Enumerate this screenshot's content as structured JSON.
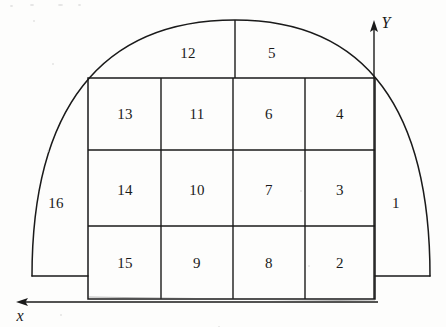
{
  "figure": {
    "title_visible": false,
    "background_color": "#fdfdfc",
    "stroke_color": "#1a1a1a",
    "axes": {
      "y_axis_label": "Y",
      "x_axis_label": "x"
    },
    "regions": [
      {
        "id": "region-1",
        "label": "1",
        "cx": 396,
        "cy": 203
      },
      {
        "id": "region-2",
        "label": "2",
        "cx": 340,
        "cy": 263
      },
      {
        "id": "region-3",
        "label": "3",
        "cx": 340,
        "cy": 190
      },
      {
        "id": "region-4",
        "label": "4",
        "cx": 340,
        "cy": 114
      },
      {
        "id": "region-5",
        "label": "5",
        "cx": 272,
        "cy": 53
      },
      {
        "id": "region-6",
        "label": "6",
        "cx": 269,
        "cy": 114
      },
      {
        "id": "region-7",
        "label": "7",
        "cx": 269,
        "cy": 190
      },
      {
        "id": "region-8",
        "label": "8",
        "cx": 269,
        "cy": 263
      },
      {
        "id": "region-9",
        "label": "9",
        "cx": 197,
        "cy": 263
      },
      {
        "id": "region-10",
        "label": "10",
        "cx": 197,
        "cy": 190
      },
      {
        "id": "region-11",
        "label": "11",
        "cx": 197,
        "cy": 114
      },
      {
        "id": "region-12",
        "label": "12",
        "cx": 188,
        "cy": 53
      },
      {
        "id": "region-13",
        "label": "13",
        "cx": 125,
        "cy": 114
      },
      {
        "id": "region-14",
        "label": "14",
        "cx": 125,
        "cy": 190
      },
      {
        "id": "region-15",
        "label": "15",
        "cx": 125,
        "cy": 263
      },
      {
        "id": "region-16",
        "label": "16",
        "cx": 56,
        "cy": 203
      }
    ],
    "geometry": {
      "grid_left": 88,
      "grid_right": 375,
      "grid_top": 78,
      "grid_bottom": 299,
      "column_lines": [
        161,
        233,
        305
      ],
      "row_lines": [
        150,
        226
      ],
      "arc_apex_y": 20,
      "arc_left_x": 32,
      "arc_right_x": 430,
      "arc_base_y": 276,
      "y_axis_x": 374,
      "y_axis_arrow_tip_y": 24,
      "x_axis_y": 302,
      "x_axis_arrow_tip_x": 18
    }
  }
}
